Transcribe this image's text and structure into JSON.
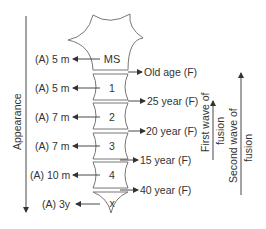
{
  "figure": {
    "axis_left": {
      "label": "Appearance",
      "direction": "down"
    },
    "axis_right_1": {
      "label_line1": "First wave of",
      "label_line2": "fusion",
      "direction": "up"
    },
    "axis_right_2": {
      "label_line1": "Second wave of",
      "label_line2": "fusion",
      "direction": "up"
    },
    "segments": [
      {
        "name": "MS",
        "appearance": "(A) 5 m",
        "fusion": "Old age (F)"
      },
      {
        "name": "1",
        "appearance": "(A) 5 m",
        "fusion": "25 year (F)"
      },
      {
        "name": "2",
        "appearance": "(A) 7 m",
        "fusion": "20 year (F)"
      },
      {
        "name": "3",
        "appearance": "(A) 7 m",
        "fusion": "15 year (F)"
      },
      {
        "name": "4",
        "appearance": "(A) 10 m",
        "fusion": "40 year (F)"
      },
      {
        "name": "x",
        "appearance": "(A) 3y",
        "fusion": ""
      }
    ]
  },
  "colors": {
    "line": "#666666",
    "text": "#333333"
  }
}
